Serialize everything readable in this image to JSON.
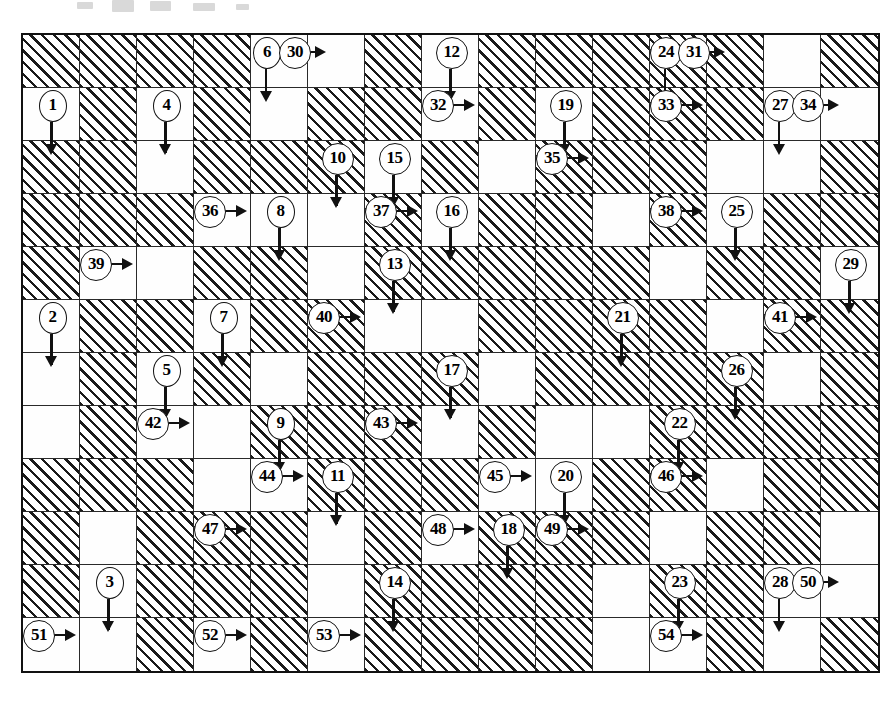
{
  "puzzle": {
    "title": "Arrow Crossword Grid",
    "type": "arrow-word crossword",
    "columns": 15,
    "rows": 12,
    "cell_width": 57,
    "cell_height": 53,
    "origin_x": 21,
    "origin_y": 33,
    "colors": {
      "ink": "#111111",
      "grid_line": "#2a2a2a",
      "paper": "#ffffff",
      "hatch": "#1a1a1a"
    },
    "blocked_cells": [
      [
        0,
        0
      ],
      [
        0,
        1
      ],
      [
        0,
        2
      ],
      [
        0,
        3
      ],
      [
        0,
        6
      ],
      [
        0,
        8
      ],
      [
        0,
        9
      ],
      [
        0,
        10
      ],
      [
        0,
        11
      ],
      [
        0,
        12
      ],
      [
        0,
        14
      ],
      [
        1,
        1
      ],
      [
        1,
        3
      ],
      [
        1,
        5
      ],
      [
        1,
        6
      ],
      [
        1,
        8
      ],
      [
        1,
        10
      ],
      [
        1,
        11
      ],
      [
        1,
        12
      ],
      [
        2,
        0
      ],
      [
        2,
        1
      ],
      [
        2,
        3
      ],
      [
        2,
        4
      ],
      [
        2,
        5
      ],
      [
        2,
        7
      ],
      [
        2,
        9
      ],
      [
        2,
        10
      ],
      [
        2,
        11
      ],
      [
        2,
        14
      ],
      [
        3,
        0
      ],
      [
        3,
        1
      ],
      [
        3,
        2
      ],
      [
        3,
        6
      ],
      [
        3,
        8
      ],
      [
        3,
        9
      ],
      [
        3,
        11
      ],
      [
        3,
        13
      ],
      [
        3,
        14
      ],
      [
        4,
        0
      ],
      [
        4,
        3
      ],
      [
        4,
        4
      ],
      [
        4,
        6
      ],
      [
        4,
        7
      ],
      [
        4,
        8
      ],
      [
        4,
        9
      ],
      [
        4,
        10
      ],
      [
        4,
        12
      ],
      [
        4,
        13
      ],
      [
        5,
        1
      ],
      [
        5,
        2
      ],
      [
        5,
        4
      ],
      [
        5,
        5
      ],
      [
        5,
        8
      ],
      [
        5,
        9
      ],
      [
        5,
        10
      ],
      [
        5,
        11
      ],
      [
        5,
        13
      ],
      [
        5,
        14
      ],
      [
        6,
        1
      ],
      [
        6,
        3
      ],
      [
        6,
        5
      ],
      [
        6,
        6
      ],
      [
        6,
        7
      ],
      [
        6,
        9
      ],
      [
        6,
        10
      ],
      [
        6,
        11
      ],
      [
        6,
        12
      ],
      [
        6,
        14
      ],
      [
        7,
        1
      ],
      [
        7,
        4
      ],
      [
        7,
        5
      ],
      [
        7,
        6
      ],
      [
        7,
        8
      ],
      [
        7,
        11
      ],
      [
        7,
        12
      ],
      [
        7,
        13
      ],
      [
        7,
        14
      ],
      [
        8,
        0
      ],
      [
        8,
        1
      ],
      [
        8,
        2
      ],
      [
        8,
        5
      ],
      [
        8,
        6
      ],
      [
        8,
        7
      ],
      [
        8,
        10
      ],
      [
        8,
        11
      ],
      [
        8,
        13
      ],
      [
        8,
        14
      ],
      [
        9,
        0
      ],
      [
        9,
        2
      ],
      [
        9,
        3
      ],
      [
        9,
        4
      ],
      [
        9,
        6
      ],
      [
        9,
        8
      ],
      [
        9,
        9
      ],
      [
        9,
        10
      ],
      [
        9,
        12
      ],
      [
        9,
        13
      ],
      [
        10,
        0
      ],
      [
        10,
        2
      ],
      [
        10,
        3
      ],
      [
        10,
        4
      ],
      [
        10,
        6
      ],
      [
        10,
        7
      ],
      [
        10,
        8
      ],
      [
        10,
        9
      ],
      [
        10,
        11
      ],
      [
        10,
        12
      ],
      [
        11,
        2
      ],
      [
        11,
        4
      ],
      [
        11,
        6
      ],
      [
        11,
        7
      ],
      [
        11,
        8
      ],
      [
        11,
        9
      ],
      [
        11,
        12
      ],
      [
        11,
        14
      ]
    ],
    "clues": [
      {
        "number": "6",
        "row": 0,
        "col": 4,
        "anchor": "left",
        "arrow": "down"
      },
      {
        "number": "30",
        "row": 0,
        "col": 4,
        "anchor": "right",
        "arrow": "right"
      },
      {
        "number": "12",
        "row": 0,
        "col": 7,
        "anchor": "center",
        "arrow": "down"
      },
      {
        "number": "24",
        "row": 0,
        "col": 11,
        "anchor": "left",
        "arrow": "down"
      },
      {
        "number": "31",
        "row": 0,
        "col": 11,
        "anchor": "right",
        "arrow": "right"
      },
      {
        "number": "1",
        "row": 1,
        "col": 0,
        "anchor": "center",
        "arrow": "down"
      },
      {
        "number": "4",
        "row": 1,
        "col": 2,
        "anchor": "center",
        "arrow": "down"
      },
      {
        "number": "32",
        "row": 1,
        "col": 7,
        "anchor": "left",
        "arrow": "right"
      },
      {
        "number": "19",
        "row": 1,
        "col": 9,
        "anchor": "center",
        "arrow": "down"
      },
      {
        "number": "33",
        "row": 1,
        "col": 11,
        "anchor": "left",
        "arrow": "right"
      },
      {
        "number": "27",
        "row": 1,
        "col": 13,
        "anchor": "left",
        "arrow": "down"
      },
      {
        "number": "34",
        "row": 1,
        "col": 13,
        "anchor": "right",
        "arrow": "right"
      },
      {
        "number": "10",
        "row": 2,
        "col": 5,
        "anchor": "center",
        "arrow": "down"
      },
      {
        "number": "15",
        "row": 2,
        "col": 6,
        "anchor": "center",
        "arrow": "down"
      },
      {
        "number": "35",
        "row": 2,
        "col": 9,
        "anchor": "left",
        "arrow": "right"
      },
      {
        "number": "36",
        "row": 3,
        "col": 3,
        "anchor": "left",
        "arrow": "right"
      },
      {
        "number": "8",
        "row": 3,
        "col": 4,
        "anchor": "center",
        "arrow": "down"
      },
      {
        "number": "37",
        "row": 3,
        "col": 6,
        "anchor": "left",
        "arrow": "right"
      },
      {
        "number": "16",
        "row": 3,
        "col": 7,
        "anchor": "center",
        "arrow": "down"
      },
      {
        "number": "38",
        "row": 3,
        "col": 11,
        "anchor": "left",
        "arrow": "right"
      },
      {
        "number": "25",
        "row": 3,
        "col": 12,
        "anchor": "center",
        "arrow": "down"
      },
      {
        "number": "39",
        "row": 4,
        "col": 1,
        "anchor": "left",
        "arrow": "right"
      },
      {
        "number": "13",
        "row": 4,
        "col": 6,
        "anchor": "center",
        "arrow": "down"
      },
      {
        "number": "29",
        "row": 4,
        "col": 14,
        "anchor": "center",
        "arrow": "down"
      },
      {
        "number": "2",
        "row": 5,
        "col": 0,
        "anchor": "center",
        "arrow": "down"
      },
      {
        "number": "7",
        "row": 5,
        "col": 3,
        "anchor": "center",
        "arrow": "down"
      },
      {
        "number": "40",
        "row": 5,
        "col": 5,
        "anchor": "left",
        "arrow": "right"
      },
      {
        "number": "21",
        "row": 5,
        "col": 10,
        "anchor": "center",
        "arrow": "down"
      },
      {
        "number": "41",
        "row": 5,
        "col": 13,
        "anchor": "left",
        "arrow": "right"
      },
      {
        "number": "5",
        "row": 6,
        "col": 2,
        "anchor": "center",
        "arrow": "down"
      },
      {
        "number": "17",
        "row": 6,
        "col": 7,
        "anchor": "center",
        "arrow": "down"
      },
      {
        "number": "26",
        "row": 6,
        "col": 12,
        "anchor": "center",
        "arrow": "down"
      },
      {
        "number": "42",
        "row": 7,
        "col": 2,
        "anchor": "left",
        "arrow": "right"
      },
      {
        "number": "9",
        "row": 7,
        "col": 4,
        "anchor": "center",
        "arrow": "down"
      },
      {
        "number": "43",
        "row": 7,
        "col": 6,
        "anchor": "left",
        "arrow": "right"
      },
      {
        "number": "22",
        "row": 7,
        "col": 11,
        "anchor": "center",
        "arrow": "down"
      },
      {
        "number": "44",
        "row": 8,
        "col": 4,
        "anchor": "left",
        "arrow": "right"
      },
      {
        "number": "11",
        "row": 8,
        "col": 5,
        "anchor": "center",
        "arrow": "down"
      },
      {
        "number": "45",
        "row": 8,
        "col": 8,
        "anchor": "left",
        "arrow": "right"
      },
      {
        "number": "20",
        "row": 8,
        "col": 9,
        "anchor": "center",
        "arrow": "down"
      },
      {
        "number": "46",
        "row": 8,
        "col": 11,
        "anchor": "left",
        "arrow": "right"
      },
      {
        "number": "47",
        "row": 9,
        "col": 3,
        "anchor": "left",
        "arrow": "right"
      },
      {
        "number": "48",
        "row": 9,
        "col": 7,
        "anchor": "left",
        "arrow": "right"
      },
      {
        "number": "18",
        "row": 9,
        "col": 8,
        "anchor": "center",
        "arrow": "down"
      },
      {
        "number": "49",
        "row": 9,
        "col": 9,
        "anchor": "left",
        "arrow": "right"
      },
      {
        "number": "3",
        "row": 10,
        "col": 1,
        "anchor": "center",
        "arrow": "down"
      },
      {
        "number": "14",
        "row": 10,
        "col": 6,
        "anchor": "center",
        "arrow": "down"
      },
      {
        "number": "23",
        "row": 10,
        "col": 11,
        "anchor": "center",
        "arrow": "down"
      },
      {
        "number": "28",
        "row": 10,
        "col": 13,
        "anchor": "left",
        "arrow": "down"
      },
      {
        "number": "50",
        "row": 10,
        "col": 13,
        "anchor": "right",
        "arrow": "right"
      },
      {
        "number": "51",
        "row": 11,
        "col": 0,
        "anchor": "left",
        "arrow": "right"
      },
      {
        "number": "52",
        "row": 11,
        "col": 3,
        "anchor": "left",
        "arrow": "right"
      },
      {
        "number": "53",
        "row": 11,
        "col": 5,
        "anchor": "left",
        "arrow": "right"
      },
      {
        "number": "54",
        "row": 11,
        "col": 11,
        "anchor": "left",
        "arrow": "right"
      }
    ],
    "artifacts": [
      {
        "x": 77,
        "y": 2,
        "w": 16,
        "h": 7
      },
      {
        "x": 112,
        "y": 0,
        "w": 22,
        "h": 12
      },
      {
        "x": 150,
        "y": 1,
        "w": 21,
        "h": 10
      },
      {
        "x": 193,
        "y": 3,
        "w": 22,
        "h": 8
      },
      {
        "x": 236,
        "y": 4,
        "w": 13,
        "h": 6
      }
    ]
  }
}
